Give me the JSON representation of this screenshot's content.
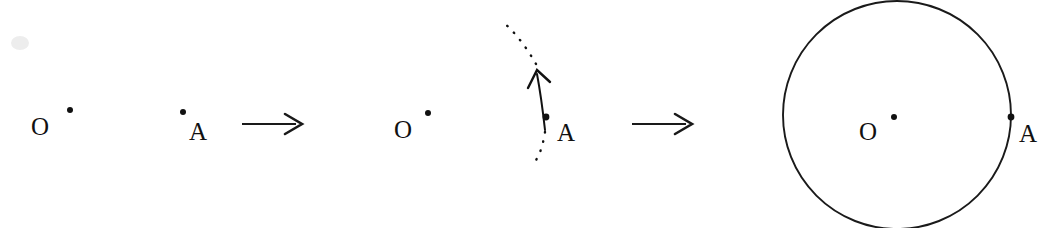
{
  "figure": {
    "canvas": {
      "width": 1055,
      "height": 228,
      "background": "#ffffff"
    },
    "ink_color": "#1a1a1a",
    "panels": [
      {
        "id": "panel-1",
        "name": "two-points",
        "caption": "Two given points",
        "labels": [
          {
            "name": "centre-label",
            "text": "O",
            "x": 31,
            "y": 135
          },
          {
            "name": "point-label",
            "text": "A",
            "x": 189,
            "y": 140
          }
        ],
        "points": [
          {
            "name": "centre-point",
            "label": "O",
            "cx": 70,
            "cy": 110,
            "r": 3.0
          },
          {
            "name": "moving-point",
            "label": "A",
            "cx": 183,
            "cy": 112,
            "r": 3.0
          }
        ]
      },
      {
        "id": "panel-2",
        "name": "rotating-point",
        "caption": "Point A swept about O",
        "labels": [
          {
            "name": "centre-label",
            "text": "O",
            "x": 394,
            "y": 138
          },
          {
            "name": "point-label",
            "text": "A",
            "x": 557,
            "y": 141
          }
        ],
        "points": [
          {
            "name": "centre-point",
            "label": "O",
            "cx": 428,
            "cy": 113,
            "r": 3.0
          },
          {
            "name": "moving-point",
            "label": "A",
            "cx": 546,
            "cy": 117,
            "r": 3.4
          }
        ],
        "sweep": {
          "name": "rotation-arc",
          "style": "solid-with-arrowhead",
          "direction": "counter-clockwise",
          "arrow_tip": {
            "x": 537,
            "y": 71
          }
        },
        "trace": {
          "name": "dashed-path",
          "style": "dotted",
          "description": "dotted continuation of the circular path above and below A"
        }
      },
      {
        "id": "panel-3",
        "name": "completed-circle",
        "caption": "The completed circle",
        "labels": [
          {
            "name": "centre-label",
            "text": "O",
            "x": 859,
            "y": 140
          },
          {
            "name": "point-label",
            "text": "A",
            "x": 1019,
            "y": 142
          }
        ],
        "points": [
          {
            "name": "centre-point",
            "label": "O",
            "cx": 894,
            "cy": 117,
            "r": 3.0
          },
          {
            "name": "circumference-point",
            "label": "A",
            "cx": 1011,
            "cy": 117,
            "r": 3.4
          }
        ],
        "circle": {
          "name": "constructed-circle",
          "cx": 897,
          "cy": 115,
          "r": 114,
          "stroke": "#1a1a1a"
        }
      }
    ],
    "arrows": [
      {
        "name": "transition-arrow-1",
        "x1": 242,
        "y1": 124,
        "x2": 302,
        "y2": 124
      },
      {
        "name": "transition-arrow-2",
        "x1": 632,
        "y1": 124,
        "x2": 692,
        "y2": 124
      }
    ]
  }
}
